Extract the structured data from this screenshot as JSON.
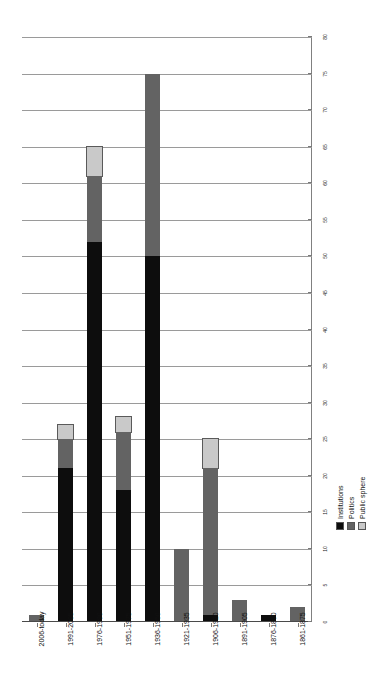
{
  "chart_data": {
    "type": "bar",
    "subtype": "stacked-bar",
    "orientation": "vertical-bars-rotated-page",
    "title": "",
    "subtitle": "",
    "xlabel": "",
    "ylabel": "",
    "ylim": [
      0,
      80
    ],
    "ytick_step": 5,
    "grid": true,
    "legend_position": "right",
    "categories": [
      "2006-today",
      "1991-2005",
      "1976-1990",
      "1951-1975",
      "1936-1950",
      "1921-1935",
      "1906-1920",
      "1891-1905",
      "1876-1890",
      "1861-1875"
    ],
    "ytick_labels": [
      "0",
      "5",
      "10",
      "15",
      "20",
      "25",
      "30",
      "35",
      "40",
      "45",
      "50",
      "55",
      "60",
      "65",
      "70",
      "75",
      "80"
    ],
    "series": [
      {
        "name": "Institutions",
        "color": "#0d0d0d",
        "values": [
          0,
          21,
          52,
          18,
          50,
          0,
          1,
          0,
          1,
          0
        ]
      },
      {
        "name": "Politics",
        "color": "#636363",
        "values": [
          1,
          4,
          9,
          8,
          25,
          10,
          20,
          3,
          0,
          2
        ]
      },
      {
        "name": "Public sphere",
        "color": "#c9c9c9",
        "values": [
          0,
          2,
          4,
          2,
          0,
          0,
          4,
          0,
          0,
          0
        ]
      }
    ],
    "totals": [
      1,
      27,
      65,
      28,
      75,
      10,
      25,
      3,
      1,
      2
    ]
  },
  "legend": {
    "items": [
      {
        "label": "Institutions",
        "color": "#0d0d0d"
      },
      {
        "label": "Politics",
        "color": "#636363"
      },
      {
        "label": "Public sphere",
        "color": "#c9c9c9"
      }
    ]
  }
}
